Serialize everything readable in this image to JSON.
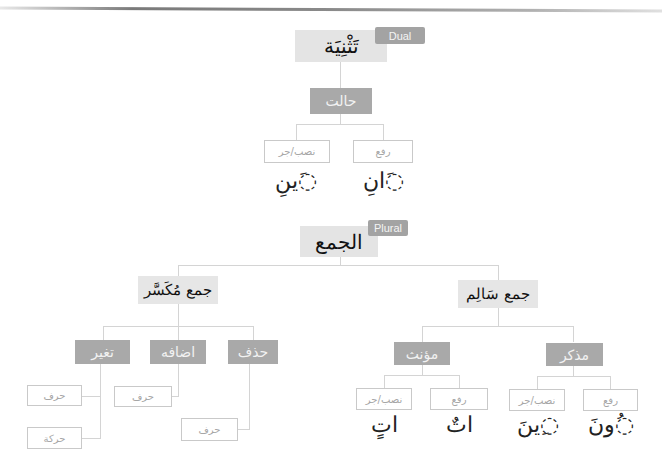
{
  "header": {
    "title_fragment": "Grammar"
  },
  "dual": {
    "tag": "Dual",
    "title": "تَثْنِيَة",
    "state": "حالت",
    "cases": [
      {
        "label": "رفع",
        "ending": "◌َانِ"
      },
      {
        "label": "نصب/جر",
        "ending": "◌َينِ"
      }
    ]
  },
  "plural": {
    "tag": "Plural",
    "title": "الجمع",
    "sound": {
      "title": "جمع سَالِم",
      "masculine": {
        "label": "مذكر",
        "cases": [
          {
            "label": "رفع",
            "ending": "◌ُونَ"
          },
          {
            "label": "نصب/جر",
            "ending": "◌ِينَ"
          }
        ]
      },
      "feminine": {
        "label": "مؤنث",
        "cases": [
          {
            "label": "رفع",
            "ending": "اتٌ"
          },
          {
            "label": "نصب/جر",
            "ending": "اتٍ"
          }
        ]
      }
    },
    "broken": {
      "title": "جمع مُكَسَّر",
      "deletion": {
        "label": "حذف",
        "children": [
          "حرف"
        ]
      },
      "addition": {
        "label": "اضافه",
        "children": [
          "حرف"
        ]
      },
      "change": {
        "label": "تغير",
        "children": [
          "حرف",
          "حركة"
        ]
      }
    }
  },
  "colors": {
    "light_box": "#e4e4e4",
    "dark_box": "#a9a9a9",
    "connector": "#d4d4d4",
    "outline": "#c9c9c9"
  }
}
